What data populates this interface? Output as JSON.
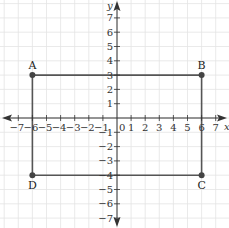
{
  "diagram": {
    "type": "coordinate-plane",
    "x_axis": {
      "label": "x",
      "min": -7,
      "max": 7,
      "ticks": [
        -7,
        -6,
        -5,
        -4,
        -3,
        -2,
        -1,
        1,
        2,
        3,
        4,
        5,
        6,
        7
      ]
    },
    "y_axis": {
      "label": "y",
      "min": -7,
      "max": 7,
      "ticks": [
        7,
        6,
        5,
        4,
        3,
        2,
        1,
        -1,
        -2,
        -3,
        -4,
        -5,
        -6,
        -7
      ]
    },
    "origin_label": "0",
    "grid": true,
    "shape": "rectangle",
    "points": [
      {
        "name": "A",
        "x": -6,
        "y": 3
      },
      {
        "name": "B",
        "x": 6,
        "y": 3
      },
      {
        "name": "C",
        "x": 6,
        "y": -4
      },
      {
        "name": "D",
        "x": -6,
        "y": -4
      }
    ],
    "colors": {
      "grid": "#e4e4e4",
      "axis": "#333333",
      "shape": "#555555",
      "point": "#444444"
    }
  }
}
